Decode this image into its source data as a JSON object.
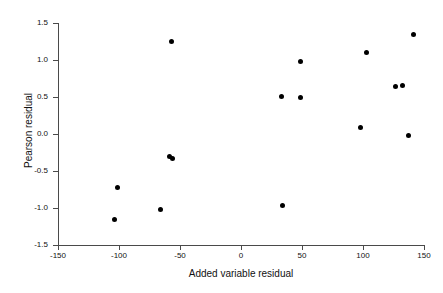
{
  "chart_data": {
    "type": "scatter",
    "title": "",
    "xlabel": "Added variable residual",
    "ylabel": "Pearson residual",
    "xlim": [
      -150,
      150
    ],
    "ylim": [
      -1.5,
      1.5
    ],
    "xticks": [
      -150,
      -100,
      -50,
      0,
      50,
      100,
      150
    ],
    "xticklabels": [
      "-150",
      "-100",
      "-50",
      "0",
      "50",
      "100",
      "150"
    ],
    "yticks": [
      -1.5,
      -1.0,
      -0.5,
      0.0,
      0.5,
      1.0,
      1.5
    ],
    "yticklabels": [
      "-1.5",
      "-1.0",
      "-0.5",
      "0.0",
      "0.5",
      "1.0",
      "1.5"
    ],
    "grid": false,
    "legend": false,
    "marker": "filled-circle",
    "marker_color": "#000000",
    "points": [
      {
        "x": -104,
        "y": -1.16
      },
      {
        "x": -101,
        "y": -0.72
      },
      {
        "x": -66,
        "y": -1.02
      },
      {
        "x": -59,
        "y": -0.3
      },
      {
        "x": -56,
        "y": -0.33
      },
      {
        "x": -57,
        "y": 1.25
      },
      {
        "x": 33,
        "y": 0.51
      },
      {
        "x": 34,
        "y": -0.96
      },
      {
        "x": 49,
        "y": 0.49
      },
      {
        "x": 49,
        "y": 0.98
      },
      {
        "x": 98,
        "y": 0.09
      },
      {
        "x": 103,
        "y": 1.1
      },
      {
        "x": 127,
        "y": 0.64
      },
      {
        "x": 132,
        "y": 0.66
      },
      {
        "x": 137,
        "y": -0.02
      },
      {
        "x": 141,
        "y": 1.35
      }
    ]
  }
}
